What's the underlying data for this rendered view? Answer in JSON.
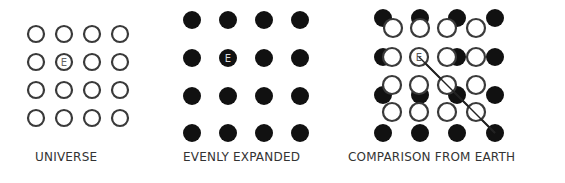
{
  "panels": [
    {
      "id": "universe",
      "label": "UNIVERSE",
      "marker": "E",
      "description": "4x4 grid of open circles; Earth at row 2, column 2"
    },
    {
      "id": "evenly-expanded",
      "label": "EVENLY EXPANDED",
      "marker": "E",
      "description": "4x4 grid of filled black circles with larger spacing; Earth at row 2, column 2"
    },
    {
      "id": "comparison-from-earth",
      "label": "COMPARISON FROM EARTH",
      "marker": "E",
      "description": "Open original-grid circles overlaid on filled expanded-grid circles aligned at Earth; arrow from Earth diagonally to the bottom-right filled circle"
    }
  ],
  "colors": {
    "stroke": "#3a3a3a",
    "fill": "#111111",
    "background": "#ffffff",
    "text": "#333333"
  }
}
